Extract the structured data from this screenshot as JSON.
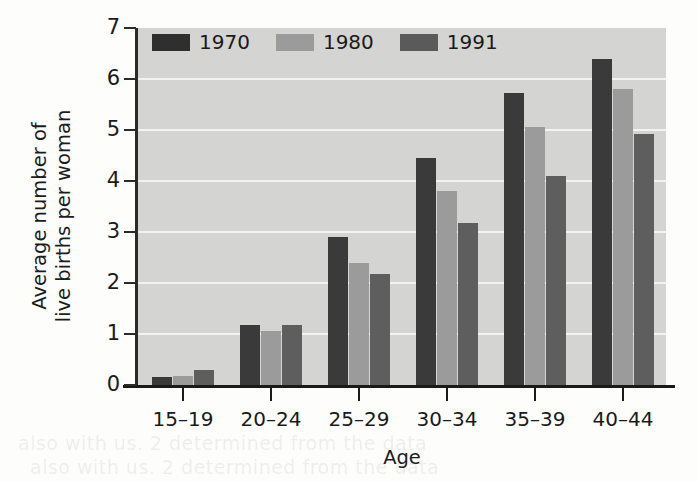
{
  "chart_data": {
    "type": "bar",
    "title": "",
    "xlabel": "Age",
    "ylabel": "Average number of\nlive births per woman",
    "categories": [
      "15–19",
      "20–24",
      "25–29",
      "30–34",
      "35–39",
      "40–44"
    ],
    "series": [
      {
        "name": "1970",
        "color": "#3a3a3a",
        "values": [
          0.15,
          1.17,
          2.9,
          4.45,
          5.73,
          6.4
        ]
      },
      {
        "name": "1980",
        "color": "#9b9b9b",
        "values": [
          0.18,
          1.05,
          2.4,
          3.8,
          5.05,
          5.8
        ]
      },
      {
        "name": "1991",
        "color": "#5e5e5e",
        "values": [
          0.3,
          1.17,
          2.17,
          3.18,
          4.1,
          4.93
        ]
      }
    ],
    "ylim": [
      0,
      7
    ],
    "yticks": [
      0,
      1,
      2,
      3,
      4,
      5,
      6,
      7
    ],
    "ytick_labels": [
      "0",
      "1",
      "2",
      "3",
      "4",
      "5",
      "6",
      "7"
    ],
    "grid": true,
    "grid_axis": "y",
    "legend_position": "top-left",
    "plot_background": "#d4d4d2",
    "gridline_color": "#f3f3f1",
    "figure_background": "#fdfdfc"
  },
  "legend": {
    "items": [
      {
        "label": "1970"
      },
      {
        "label": "1980"
      },
      {
        "label": "1991"
      }
    ]
  },
  "ghost_text": {
    "line1": "also with us. 2 determined from the data",
    "line2": "also with us. 2 determined from the data"
  }
}
